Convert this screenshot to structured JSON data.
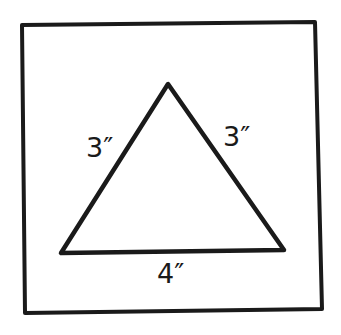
{
  "figure": {
    "stroke_color": "#1a1a1a",
    "background": "#ffffff",
    "frame": {
      "points": [
        [
          22,
          25
        ],
        [
          315,
          22
        ],
        [
          322,
          309
        ],
        [
          25,
          313
        ]
      ]
    },
    "triangle": {
      "apex": [
        168,
        84
      ],
      "bottom_left": [
        61,
        253
      ],
      "bottom_right": [
        284,
        250
      ]
    },
    "labels": {
      "left_side": "3″",
      "right_side": "3″",
      "base": "4″"
    }
  }
}
